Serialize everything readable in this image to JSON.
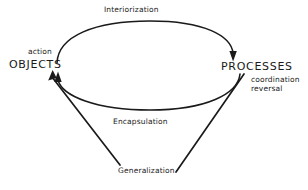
{
  "diagram": {
    "background_color": "#ffffff",
    "stroke_color": "#1a1a1a",
    "nodes": [
      {
        "id": "objects",
        "label": "OBJECTS",
        "x": 9,
        "y": 59
      },
      {
        "id": "processes",
        "label": "PROCESSES",
        "x": 221,
        "y": 61
      }
    ],
    "annotations": {
      "action": "action",
      "coordination": "coordination",
      "reversal": "reversal"
    },
    "edges": [
      {
        "id": "interiorization",
        "label": "Interiorization",
        "from": "objects",
        "to": "processes",
        "direction": "right",
        "shape": "upper-arc"
      },
      {
        "id": "encapsulation",
        "label": "Encapsulation",
        "from": "processes",
        "to": "objects",
        "direction": "left",
        "shape": "lower-arc"
      },
      {
        "id": "generalization",
        "label": "Generalization",
        "from": "processes",
        "to": "objects",
        "direction": "left",
        "shape": "v-path"
      }
    ]
  }
}
